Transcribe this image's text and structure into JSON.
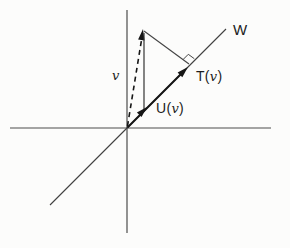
{
  "figure": {
    "labels": {
      "w_line": "W",
      "v_vector": "v",
      "t_name": "T",
      "u_name": "U",
      "arg_v": "v",
      "paren_open": "(",
      "paren_close": ")"
    },
    "colors": {
      "background": "#fcfcfb",
      "axis": "#4c4c4c",
      "w_line": "#3f3f3f",
      "vector": "#161616",
      "text": "#1d1d1d"
    }
  }
}
